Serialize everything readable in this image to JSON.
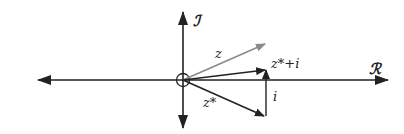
{
  "diagram": {
    "axes": {
      "real_label": "ℛ",
      "imag_label": "ℐ"
    },
    "vectors": [
      {
        "name": "z",
        "label": "z",
        "color": "#8a8a8a"
      },
      {
        "name": "z_conj",
        "label": "z*",
        "color": "#222222"
      },
      {
        "name": "z_conj_plus_i",
        "label": "z*+i",
        "color": "#222222"
      },
      {
        "name": "i",
        "label": "i",
        "color": "#222222"
      }
    ],
    "colors": {
      "axis": "#222222",
      "z_vector": "#8a8a8a",
      "background": "#ffffff"
    }
  }
}
